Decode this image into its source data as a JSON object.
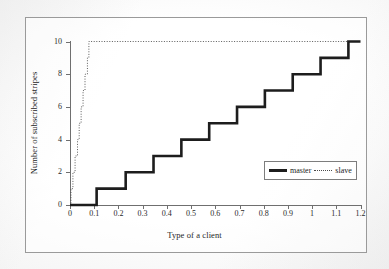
{
  "figure": {
    "caption": "",
    "border_color": "#9a9a9a"
  },
  "chart_data": {
    "type": "line",
    "title": "",
    "xlabel": "Type of a client",
    "ylabel": "Number of subscribed stripes",
    "xlim": [
      0,
      1.2
    ],
    "ylim": [
      0,
      10
    ],
    "grid": false,
    "legend_position": "lower right",
    "xticks": [
      0,
      0.1,
      0.2,
      0.3,
      0.4,
      0.5,
      0.6,
      0.7,
      0.8,
      0.9,
      1,
      1.1,
      1.2
    ],
    "xtick_labels": [
      "0",
      "0.1",
      "0.2",
      "0.3",
      "0.4",
      "0.5",
      "0.6",
      "0.7",
      "0.8",
      "0.9",
      "1",
      "1.1",
      "1.2"
    ],
    "yticks": [
      0,
      2,
      4,
      6,
      8,
      10
    ],
    "ytick_labels": [
      "0",
      "2",
      "4",
      "6",
      "8",
      "10"
    ],
    "series": [
      {
        "name": "master",
        "style": "solid",
        "color": "#1d1d1d",
        "line_width": 2.6,
        "drawstyle": "steps-post",
        "x": [
          0,
          0.11,
          0.11,
          0.23,
          0.23,
          0.345,
          0.345,
          0.46,
          0.46,
          0.575,
          0.575,
          0.69,
          0.69,
          0.805,
          0.805,
          0.92,
          0.92,
          1.035,
          1.035,
          1.15,
          1.15,
          1.2
        ],
        "y": [
          0,
          0,
          1,
          1,
          2,
          2,
          3,
          3,
          4,
          4,
          5,
          5,
          6,
          6,
          7,
          7,
          8,
          8,
          9,
          9,
          10,
          10
        ]
      },
      {
        "name": "slave",
        "style": "dotted",
        "color": "#4a4a4a",
        "line_width": 0.9,
        "drawstyle": "steps-post",
        "x": [
          0,
          0.004,
          0.004,
          0.012,
          0.012,
          0.016,
          0.016,
          0.021,
          0.021,
          0.026,
          0.026,
          0.031,
          0.031,
          0.034,
          0.034,
          0.038,
          0.038,
          0.042,
          0.042,
          0.046,
          0.046,
          0.05,
          0.05,
          0.054,
          0.054,
          0.058,
          0.058,
          0.062,
          0.062,
          0.067,
          0.067,
          0.072,
          0.072,
          0.078,
          0.078,
          0.083,
          0.083,
          1.2
        ],
        "y": [
          0,
          0,
          1,
          1,
          2,
          2,
          2,
          2,
          3,
          3,
          3,
          3,
          4,
          4,
          4,
          4,
          5,
          5,
          5,
          5,
          6,
          6,
          6,
          6,
          7,
          7,
          7,
          7,
          8,
          8,
          8,
          8,
          9,
          9,
          10,
          10,
          10,
          10
        ]
      }
    ]
  },
  "legend": {
    "items": [
      {
        "label": "master",
        "swatch": "solid-thick"
      },
      {
        "label": "slave",
        "swatch": "dotted-thin"
      }
    ]
  }
}
